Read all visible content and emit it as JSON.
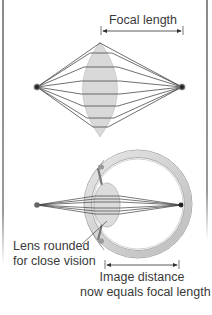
{
  "figure": {
    "top_panel": {
      "title": "Focal length",
      "focal_arrow": {
        "x_start": 101,
        "x_end": 183,
        "y": 31
      },
      "left_point": {
        "x": 37,
        "y": 87
      },
      "right_point": {
        "x": 182,
        "y": 87
      },
      "lens": {
        "cx": 100,
        "cy": 89,
        "half_width": 21,
        "top": 42,
        "bottom": 137
      },
      "ray_count": 9
    },
    "bottom_panel": {
      "label_lens": [
        "Lens rounded",
        "for close vision"
      ],
      "label_image_distance": [
        "Image distance",
        "now equals focal length"
      ],
      "left_point": {
        "x": 37,
        "y": 205
      },
      "focal_point": {
        "x": 181,
        "y": 205
      },
      "image_distance_arrow": {
        "x_start": 105,
        "x_end": 179,
        "y": 265
      }
    },
    "colors": {
      "background": "#ffffff",
      "lens_fill": "#d9d9d9",
      "ray": "#404040",
      "point": "#333333",
      "eye_wall": "#c8c8c8",
      "text": "#3a3a3a",
      "frame": "#8a8a8a"
    }
  }
}
